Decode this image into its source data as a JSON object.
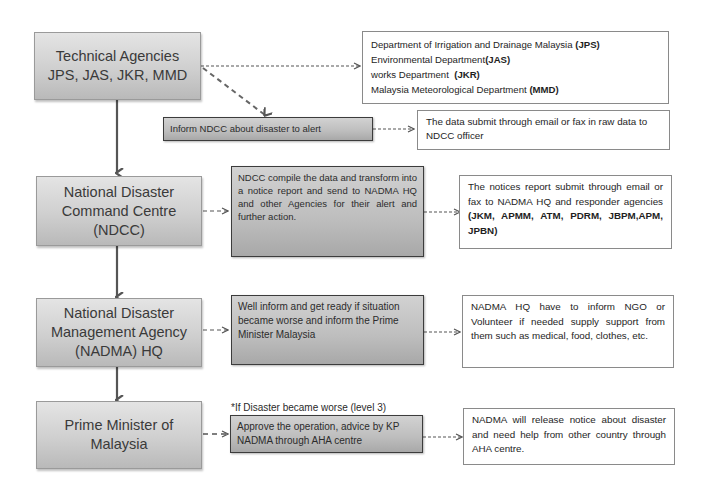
{
  "diagram": {
    "type": "flowchart",
    "main_column": [
      {
        "id": "technical-agencies",
        "line1": "Technical Agencies",
        "line2": "JPS, JAS, JKR, MMD"
      },
      {
        "id": "ndcc",
        "line1": "National Disaster",
        "line2": "Command Centre",
        "line3": "(NDCC)"
      },
      {
        "id": "nadma",
        "line1": "National Disaster",
        "line2": "Management Agency",
        "line3": "(NADMA) HQ"
      },
      {
        "id": "prime-minister",
        "line1": "Prime Minister of",
        "line2": "Malaysia"
      }
    ],
    "action_boxes": {
      "inform_ndcc": "Inform NDCC about disaster to alert",
      "ndcc_compile": "NDCC compile the data  and transform into a notice report and send to NADMA HQ and other Agencies for their alert and further action.",
      "nadma_inform": "Well inform and get ready if situation became worse and inform the Prime Minister Malaysia",
      "pm_approve": "Approve the operation, advice by KP NADMA through AHA centre"
    },
    "level3_caption": "*If Disaster became worse (level 3)",
    "notes": {
      "agencies": {
        "line1_text": "Department of Irrigation and Drainage Malaysia ",
        "line1_abbr": "(JPS)",
        "line2_text": "Environmental Department",
        "line2_abbr": "(JAS)",
        "line3_text": "works Department  ",
        "line3_abbr": "(JKR)",
        "line4_text": "Malaysia Meteorological Department ",
        "line4_abbr": "(MMD)"
      },
      "raw_data": "The data submit through email or fax in raw data to NDCC officer",
      "notice_report": {
        "text": "The notices report submit through email or fax to NADMA HQ and responder agencies ",
        "agencies_bold": "(JKM, APMM, ATM, PDRM, JBPM,APM, JPBN)"
      },
      "ngo": "NADMA HQ have to inform NGO or Volunteer if needed supply support from them  such as medical, food, clothes, etc.",
      "aha": "NADMA will release notice about disaster and need help from other country through AHA centre."
    },
    "colors": {
      "main_box_fill": "#cfcfcf",
      "action_box_fill": "#bdbdbd",
      "note_box_fill": "#ffffff",
      "arrow": "#555555"
    }
  }
}
